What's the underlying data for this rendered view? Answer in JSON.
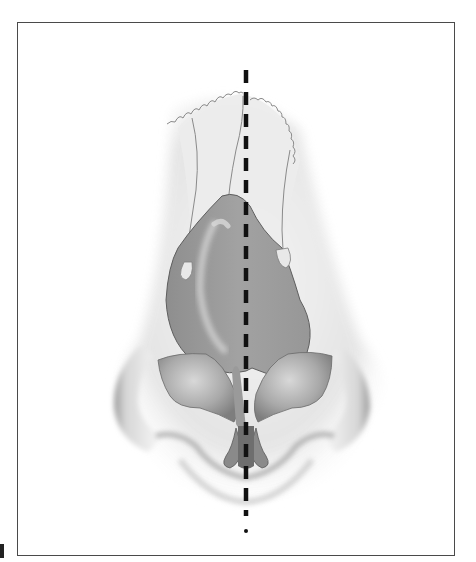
{
  "figure": {
    "midline": {
      "style": "dashed",
      "color": "#111111"
    },
    "colors": {
      "frame_border": "#4a4a4a",
      "skin_light": "#e4e4e4",
      "skin_shadow": "#a8a8a8",
      "cartilage": "#9a9a9a",
      "cartilage_dark": "#6e6e6e",
      "highlight": "#c8c8c8",
      "outline": "#7a7a7a"
    },
    "parts": [
      "nasal-bones",
      "upper-lateral-cartilage",
      "septum",
      "lower-lateral-cartilages",
      "alar-rims",
      "columella",
      "midline"
    ]
  },
  "corner_label": {
    "visible_fragment": true
  }
}
